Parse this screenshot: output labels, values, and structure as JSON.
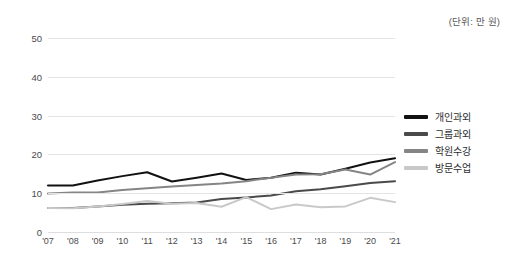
{
  "unit_caption": "(단위: 만 원)",
  "legend": {
    "items": [
      {
        "label": "개인과외",
        "color": "#111111"
      },
      {
        "label": "그룹과외",
        "color": "#4a4a4a"
      },
      {
        "label": "학원수강",
        "color": "#858585"
      },
      {
        "label": "방문수업",
        "color": "#c9c9c9"
      }
    ]
  },
  "chart_data": {
    "type": "line",
    "title": "",
    "subtitle": "",
    "xlabel": "",
    "ylabel": "",
    "unit": "만 원",
    "grid": true,
    "legend_position": "right",
    "xlim": [
      0,
      14
    ],
    "ylim": [
      0,
      50
    ],
    "yticks": [
      0,
      10,
      20,
      30,
      40,
      50
    ],
    "ytick_labels": [
      "0",
      "10",
      "20",
      "30",
      "40",
      "50"
    ],
    "categories": [
      "'07",
      "'08",
      "'09",
      "'10",
      "'11",
      "'12",
      "'13",
      "'14",
      "'15",
      "'16",
      "'17",
      "'18",
      "'19",
      "'20",
      "'21"
    ],
    "series": [
      {
        "name": "개인과외",
        "color": "#111111",
        "values": [
          12.0,
          12.0,
          13.3,
          14.4,
          15.4,
          13.0,
          14.0,
          15.1,
          13.4,
          14.0,
          15.3,
          14.8,
          16.3,
          17.9,
          19.0
        ]
      },
      {
        "name": "그룹과외",
        "color": "#4a4a4a",
        "values": [
          6.2,
          6.2,
          6.6,
          7.0,
          7.3,
          7.4,
          7.6,
          8.5,
          8.9,
          9.4,
          10.5,
          11.0,
          11.8,
          12.6,
          13.1
        ]
      },
      {
        "name": "학원수강",
        "color": "#858585",
        "values": [
          9.9,
          10.2,
          10.2,
          10.8,
          11.3,
          11.7,
          12.1,
          12.5,
          13.1,
          14.0,
          14.8,
          14.9,
          16.1,
          14.8,
          18.0
        ]
      },
      {
        "name": "방문수업",
        "color": "#c9c9c9",
        "values": [
          6.2,
          6.1,
          6.6,
          7.2,
          8.0,
          7.3,
          7.5,
          6.5,
          9.0,
          5.9,
          7.1,
          6.4,
          6.6,
          8.8,
          7.7
        ]
      }
    ]
  }
}
